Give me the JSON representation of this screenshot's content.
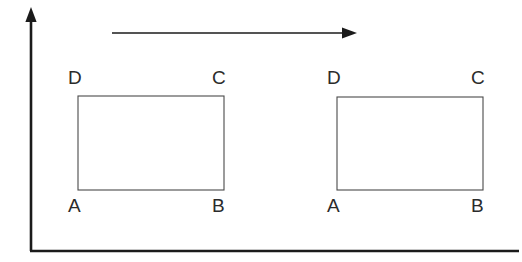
{
  "figure": {
    "background_color": "#ffffff",
    "width": 522,
    "height": 262,
    "axes": {
      "name": "coordinate-axes",
      "color": "#1b1b1b",
      "stroke_width": 2.6,
      "vertical": {
        "x": 31,
        "y_top": 12,
        "y_bottom": 251,
        "arrow": "up"
      },
      "horizontal": {
        "y": 251,
        "x_left": 31,
        "x_right": 519,
        "arrow": "none"
      }
    },
    "motion_arrow": {
      "name": "translation-arrow",
      "color": "#1b1b1b",
      "stroke_width": 1.4,
      "x_start": 112,
      "x_end": 356,
      "y": 33,
      "direction": "right"
    },
    "shapes": [
      {
        "name": "rectangle-left",
        "stroke_color": "#4a4a4a",
        "stroke_width": 1.1,
        "fill": "none",
        "x": 78,
        "y": 96,
        "width": 146,
        "height": 94,
        "vertices": [
          {
            "label": "D",
            "corner": "top-left",
            "label_x": 68,
            "label_y": 68
          },
          {
            "label": "C",
            "corner": "top-right",
            "label_x": 212,
            "label_y": 68
          },
          {
            "label": "A",
            "corner": "bottom-left",
            "label_x": 68,
            "label_y": 196
          },
          {
            "label": "B",
            "corner": "bottom-right",
            "label_x": 212,
            "label_y": 196
          }
        ]
      },
      {
        "name": "rectangle-right",
        "stroke_color": "#4a4a4a",
        "stroke_width": 1.1,
        "fill": "none",
        "x": 337,
        "y": 97,
        "width": 146,
        "height": 93,
        "vertices": [
          {
            "label": "D",
            "corner": "top-left",
            "label_x": 327,
            "label_y": 68
          },
          {
            "label": "C",
            "corner": "top-right",
            "label_x": 471,
            "label_y": 68
          },
          {
            "label": "A",
            "corner": "bottom-left",
            "label_x": 327,
            "label_y": 196
          },
          {
            "label": "B",
            "corner": "bottom-right",
            "label_x": 471,
            "label_y": 196
          }
        ]
      }
    ]
  }
}
